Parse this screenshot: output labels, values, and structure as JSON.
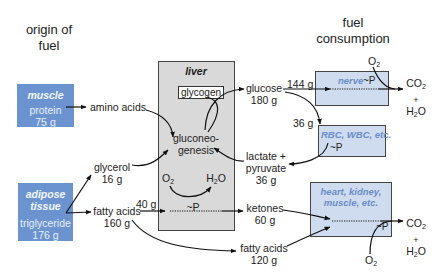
{
  "headings": {
    "origin": [
      "origin of",
      "fuel"
    ],
    "consumption": [
      "fuel",
      "consumption"
    ]
  },
  "sources": {
    "muscle": {
      "label": "muscle",
      "substance": "protein",
      "amount": "75 g"
    },
    "adipose": {
      "label_line1": "adipose",
      "label_line2": "tissue",
      "substance": "triglyceride",
      "amount": "176 g"
    }
  },
  "intermediates": {
    "amino_acids": "amino acids",
    "glycerol": {
      "name": "glycerol",
      "amount": "16 g"
    },
    "fatty_acids_in": {
      "name": "fatty acids",
      "amount": "160 g"
    },
    "fatty_acids_to_liver": "40 g",
    "glucose": {
      "name": "glucose",
      "amount": "180 g"
    },
    "glucose_to_nerve": "144 g",
    "glucose_to_rbc": "36 g",
    "lactate": {
      "line1": "lactate +",
      "line2": "pyruvate",
      "amount": "36 g"
    },
    "ketones": {
      "name": "ketones",
      "amount": "60 g"
    },
    "fatty_acids_out": {
      "name": "fatty acids",
      "amount": "120 g"
    }
  },
  "liver": {
    "label": "liver",
    "glycogen": "glycogen",
    "gluconeo_line1": "gluconeo-",
    "gluconeo_line2": "genesis",
    "o2": "O",
    "h2o_h": "H",
    "h2o_o": "O",
    "atp": "~P"
  },
  "consumers": {
    "nerve": {
      "label": "nerve",
      "atp": "~P"
    },
    "rbc": {
      "label": "RBC, WBC, etc.",
      "atp": "~P"
    },
    "heart": {
      "line1": "heart, kidney,",
      "line2": "muscle, etc.",
      "atp": "~P"
    }
  },
  "products": {
    "co2": "CO",
    "plus": "+",
    "h2o_h": "H",
    "h2o_o": "O",
    "o2": "O",
    "sub2": "2"
  },
  "colors": {
    "source_box": "#6b93cf",
    "liver_box": "#d9d9d9",
    "consumer_box": "#cfdcef",
    "consumer_label": "#6a8cc8",
    "arrow": "#111111"
  }
}
